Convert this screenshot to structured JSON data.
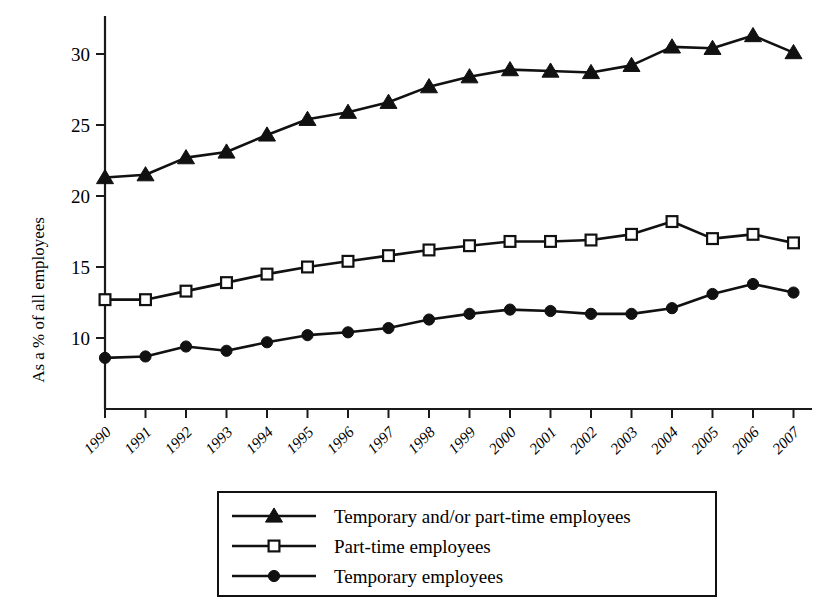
{
  "chart_data": {
    "type": "line",
    "title": "",
    "subtitle": "",
    "xlabel": "",
    "ylabel": "As a % of all employees",
    "categories": [
      "1990",
      "1991",
      "1992",
      "1993",
      "1994",
      "1995",
      "1996",
      "1997",
      "1998",
      "1999",
      "2000",
      "2001",
      "2002",
      "2003",
      "2004",
      "2005",
      "2006",
      "2007"
    ],
    "x": [
      1990,
      1991,
      1992,
      1993,
      1994,
      1995,
      1996,
      1997,
      1998,
      1999,
      2000,
      2001,
      2002,
      2003,
      2004,
      2005,
      2006,
      2007
    ],
    "ylim": [
      7.5,
      32.5
    ],
    "xlim": [
      1990,
      2007
    ],
    "yticks": [
      10,
      15,
      20,
      25,
      30
    ],
    "ytick_labels": [
      "10",
      "15",
      "20",
      "25",
      "30"
    ],
    "grid": false,
    "legend_position": "bottom-center",
    "series": [
      {
        "name": "Temporary and/or part-time employees",
        "marker": "filled-triangle",
        "color": "#111111",
        "values": [
          21.3,
          21.5,
          22.7,
          23.1,
          24.3,
          25.4,
          25.9,
          26.6,
          27.7,
          28.4,
          28.9,
          28.8,
          28.7,
          29.2,
          30.5,
          30.4,
          31.3,
          30.1
        ]
      },
      {
        "name": "Part-time employees",
        "marker": "open-square",
        "color": "#111111",
        "values": [
          12.7,
          12.7,
          13.3,
          13.9,
          14.5,
          15.0,
          15.4,
          15.8,
          16.2,
          16.5,
          16.8,
          16.8,
          16.9,
          17.3,
          18.2,
          17.0,
          17.3,
          16.7
        ]
      },
      {
        "name": "Temporary employees",
        "marker": "filled-circle",
        "color": "#111111",
        "values": [
          8.6,
          8.7,
          9.4,
          9.1,
          9.7,
          10.2,
          10.4,
          10.7,
          11.3,
          11.7,
          12.0,
          11.9,
          11.7,
          11.7,
          12.1,
          13.1,
          13.8,
          13.2
        ]
      }
    ]
  },
  "legend": {
    "entries": [
      {
        "label": "Temporary and/or part-time employees",
        "marker": "filled-triangle"
      },
      {
        "label": "Part-time employees",
        "marker": "open-square"
      },
      {
        "label": "Temporary employees",
        "marker": "filled-circle"
      }
    ]
  },
  "axes": {
    "y_axis_title": "As a % of all employees"
  }
}
